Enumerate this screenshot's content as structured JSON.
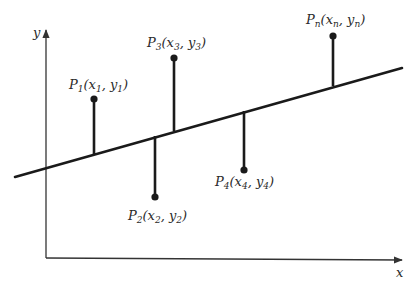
{
  "diagram": {
    "axes": {
      "x_label": "x",
      "y_label": "y"
    },
    "points": [
      {
        "id": "P1",
        "name": "P",
        "sub": "1",
        "open": "(",
        "x": "x",
        "xsub": "1",
        "comma": ", ",
        "y": "y",
        "ysub": "1",
        "close": ")"
      },
      {
        "id": "P2",
        "name": "P",
        "sub": "2",
        "open": "(",
        "x": "x",
        "xsub": "2",
        "comma": ", ",
        "y": "y",
        "ysub": "2",
        "close": ")"
      },
      {
        "id": "P3",
        "name": "P",
        "sub": "3",
        "open": "(",
        "x": "x",
        "xsub": "3",
        "comma": ", ",
        "y": "y",
        "ysub": "3",
        "close": ")"
      },
      {
        "id": "P4",
        "name": "P",
        "sub": "4",
        "open": "(",
        "x": "x",
        "xsub": "4",
        "comma": ", ",
        "y": "y",
        "ysub": "4",
        "close": ")"
      },
      {
        "id": "Pn",
        "name": "P",
        "sub": "n",
        "open": "(",
        "x": "x",
        "xsub": "n",
        "comma": ", ",
        "y": "y",
        "ysub": "n",
        "close": ")"
      }
    ],
    "colors": {
      "ink": "#1a1a1a",
      "axis": "#333333",
      "background": "#ffffff"
    }
  }
}
